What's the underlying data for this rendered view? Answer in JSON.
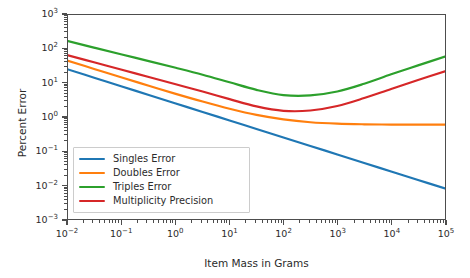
{
  "chart_data": {
    "type": "line",
    "title": "",
    "xlabel": "Item Mass in Grams",
    "ylabel": "Percent Error",
    "xscale": "log",
    "yscale": "log",
    "xlim": [
      0.01,
      100000
    ],
    "ylim": [
      0.001,
      1000
    ],
    "grid": false,
    "legend_position": "lower left",
    "xticks": [
      {
        "value": 0.01,
        "label": "10-2",
        "mantissa": "10",
        "exponent": "−2"
      },
      {
        "value": 0.1,
        "label": "10-1",
        "mantissa": "10",
        "exponent": "−1"
      },
      {
        "value": 1,
        "label": "100",
        "mantissa": "10",
        "exponent": "0"
      },
      {
        "value": 10,
        "label": "101",
        "mantissa": "10",
        "exponent": "1"
      },
      {
        "value": 100,
        "label": "102",
        "mantissa": "10",
        "exponent": "2"
      },
      {
        "value": 1000,
        "label": "103",
        "mantissa": "10",
        "exponent": "3"
      },
      {
        "value": 10000,
        "label": "104",
        "mantissa": "10",
        "exponent": "4"
      },
      {
        "value": 100000,
        "label": "105",
        "mantissa": "10",
        "exponent": "5"
      }
    ],
    "yticks": [
      {
        "value": 1000,
        "mantissa": "10",
        "exponent": "3"
      },
      {
        "value": 100,
        "mantissa": "10",
        "exponent": "2"
      },
      {
        "value": 10,
        "mantissa": "10",
        "exponent": "1"
      },
      {
        "value": 1,
        "mantissa": "10",
        "exponent": "0"
      },
      {
        "value": 0.1,
        "mantissa": "10",
        "exponent": "−1"
      },
      {
        "value": 0.01,
        "mantissa": "10",
        "exponent": "−2"
      },
      {
        "value": 0.001,
        "mantissa": "10",
        "exponent": "−3"
      }
    ],
    "x": [
      0.01,
      0.0316,
      0.1,
      0.316,
      1,
      3.16,
      10,
      31.6,
      100,
      316,
      1000,
      3160,
      10000,
      31600,
      100000
    ],
    "series": [
      {
        "name": "Singles Error",
        "color": "#1f77b4",
        "values": [
          25.0,
          14.1,
          7.9,
          4.45,
          2.5,
          1.41,
          0.79,
          0.445,
          0.25,
          0.141,
          0.079,
          0.0445,
          0.025,
          0.0141,
          0.0079
        ]
      },
      {
        "name": "Doubles Error",
        "color": "#ff7f0e",
        "values": [
          45.0,
          25.5,
          14.5,
          8.3,
          4.8,
          2.85,
          1.75,
          1.15,
          0.85,
          0.7,
          0.635,
          0.61,
          0.6,
          0.6,
          0.6
        ]
      },
      {
        "name": "Triples Error",
        "color": "#2ca02c",
        "values": [
          170.0,
          108.0,
          69.0,
          44.0,
          28.0,
          17.5,
          10.5,
          6.3,
          4.4,
          4.3,
          5.6,
          9.5,
          18.0,
          33.0,
          60.0
        ]
      },
      {
        "name": "Multiplicity Precision",
        "color": "#d62728",
        "values": [
          65.0,
          40.0,
          24.5,
          15.0,
          9.2,
          5.6,
          3.35,
          2.05,
          1.52,
          1.55,
          2.1,
          3.6,
          6.7,
          12.3,
          22.0
        ]
      }
    ],
    "legend": [
      {
        "label": "Singles Error",
        "color": "#1f77b4"
      },
      {
        "label": "Doubles Error",
        "color": "#ff7f0e"
      },
      {
        "label": "Triples Error",
        "color": "#2ca02c"
      },
      {
        "label": "Multiplicity Precision",
        "color": "#d62728"
      }
    ],
    "axis_color": "#4d4d4d",
    "background": "#ffffff"
  }
}
